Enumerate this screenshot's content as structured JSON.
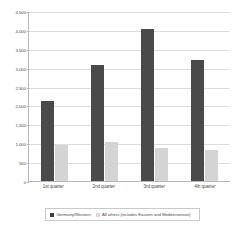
{
  "chart_data": {
    "type": "bar",
    "title": "",
    "subtitle": "",
    "xlabel": "",
    "ylabel": "",
    "categories": [
      "1st quarter",
      "2nd quarter",
      "3rd quarter",
      "4th quarter"
    ],
    "series": [
      {
        "name": "Germany/Western",
        "color": "#4a4a4a",
        "values": [
          2120,
          3060,
          4030,
          3200
        ]
      },
      {
        "name": "All others (includes Eastern and Mediterranean)",
        "color": "#d4d4d4",
        "values": [
          950,
          1020,
          880,
          810
        ]
      }
    ],
    "ylim": [
      0,
      4500
    ],
    "ytick_step": 500,
    "yticks": [
      0,
      500,
      1000,
      1500,
      2000,
      2500,
      3000,
      3500,
      4000,
      4500
    ],
    "ytick_labels": [
      "0",
      "500",
      "1,000",
      "1,500",
      "2,000",
      "2,500",
      "3,000",
      "3,500",
      "4,000",
      "4,500"
    ],
    "grid": true,
    "grid_axis": "y",
    "legend_position": "bottom",
    "legend": [
      "Germany/Western",
      "All others (includes Eastern and Mediterranean)"
    ]
  }
}
